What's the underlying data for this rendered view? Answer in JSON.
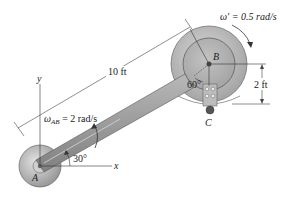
{
  "figure": {
    "type": "mechanism-diagram",
    "labels": {
      "point_a": "A",
      "point_b": "B",
      "point_c": "C",
      "axis_x": "x",
      "axis_y": "y",
      "omega_ab_symbol": "ω",
      "omega_ab_sub": "AB",
      "omega_ab_value": " = 2 rad/s",
      "omega_prime": "ω′ = 0.5 rad/s",
      "length_rod": "10 ft",
      "radius_c": "2 ft",
      "angle_rod": "30°",
      "angle_c": "60°"
    },
    "values": {
      "rod_length_ft": 10,
      "omega_ab_rad_s": 2,
      "omega_prime_rad_s": 0.5,
      "radius_bc_ft": 2,
      "rod_angle_deg": 30,
      "angle_c_deg": 60
    },
    "colors": {
      "disk_outer": "#bdbdbd",
      "disk_inner": "#a8a8a8",
      "rod": "#9a9a9a",
      "line": "#333333"
    }
  }
}
